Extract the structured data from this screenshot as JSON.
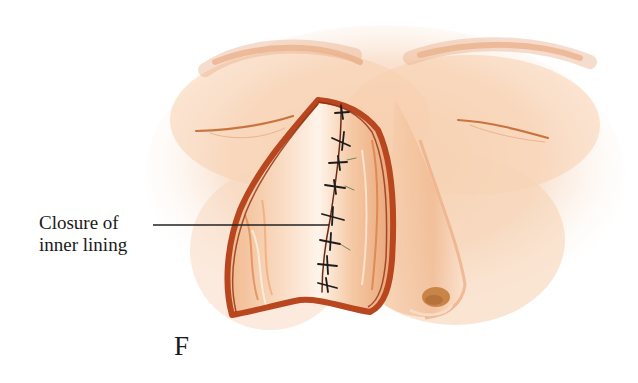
{
  "figure": {
    "panel_letter": "F",
    "callout": {
      "line1": "Closure of",
      "line2": "inner lining",
      "target": "midline suture line of nasal inner lining"
    },
    "colors": {
      "skin_light": "#f6d2b4",
      "skin_mid": "#eeb58c",
      "skin_shadow": "#e39a6a",
      "flap_edge": "#b8461f",
      "flap_dark": "#8e2f12",
      "suture": "#1c1c1c",
      "leader_line": "#222222",
      "background": "#ffffff"
    },
    "sutures_count": 8
  }
}
